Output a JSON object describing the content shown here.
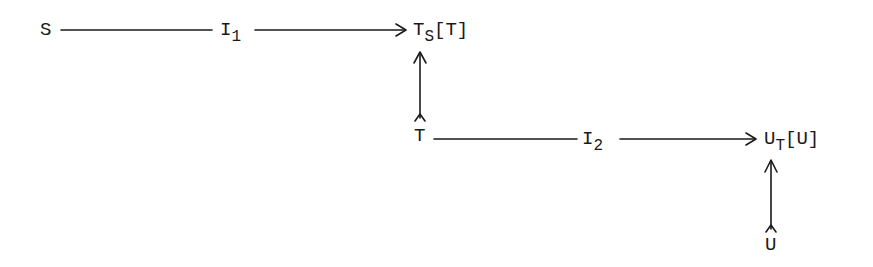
{
  "diagram": {
    "type": "commutative-diagram",
    "nodes": {
      "S": {
        "base": "S",
        "sub": "",
        "rest": ""
      },
      "I1": {
        "base": "I",
        "sub": "1",
        "rest": ""
      },
      "TS_T": {
        "base": "T",
        "sub": "S",
        "rest": "[T]"
      },
      "T": {
        "base": "T",
        "sub": "",
        "rest": ""
      },
      "I2": {
        "base": "I",
        "sub": "2",
        "rest": ""
      },
      "UT_U": {
        "base": "U",
        "sub": "T",
        "rest": "[U]"
      },
      "U": {
        "base": "U",
        "sub": "",
        "rest": ""
      }
    },
    "edges": [
      {
        "from": "S",
        "to": "TS[T]",
        "label": "I1",
        "style": "arrow"
      },
      {
        "from": "T",
        "to": "TS[T]",
        "label": "",
        "style": "inclusion-arrow"
      },
      {
        "from": "T",
        "to": "UT[U]",
        "label": "I2",
        "style": "arrow"
      },
      {
        "from": "U",
        "to": "UT[U]",
        "label": "",
        "style": "inclusion-arrow"
      }
    ],
    "colors": {
      "ink": "#1a1a1a",
      "background": "#ffffff"
    }
  }
}
